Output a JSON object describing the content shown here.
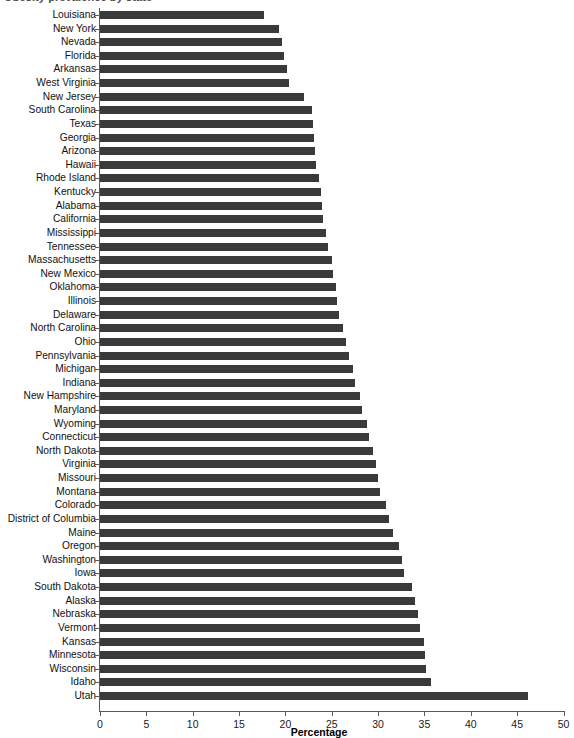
{
  "chart": {
    "title_partial": "Obesity prevalence by state",
    "xlabel": "Percentage",
    "ylabel": ""
  },
  "axis": {
    "x_ticks": [
      0,
      5,
      10,
      15,
      20,
      25,
      30,
      35,
      40,
      45,
      50
    ],
    "x_tick_labels": [
      "0",
      "5",
      "10",
      "15",
      "20",
      "25",
      "30",
      "35",
      "40",
      "45",
      "50"
    ]
  },
  "colors": {
    "bar": "#3a3a3a",
    "axis": "#5a5a5a",
    "text": "#111111",
    "background": "#ffffff"
  },
  "chart_data": {
    "type": "bar",
    "orientation": "horizontal",
    "xlabel": "Percentage",
    "ylabel": "",
    "xlim": [
      0,
      50
    ],
    "grid": false,
    "legend": null,
    "categories": [
      "Louisiana",
      "New York",
      "Nevada",
      "Florida",
      "Arkansas",
      "West Virginia",
      "New Jersey",
      "South Carolina",
      "Texas",
      "Georgia",
      "Arizona",
      "Hawaii",
      "Rhode Island",
      "Kentucky",
      "Alabama",
      "California",
      "Mississippi",
      "Tennessee",
      "Massachusetts",
      "New Mexico",
      "Oklahoma",
      "Illinois",
      "Delaware",
      "North Carolina",
      "Ohio",
      "Pennsylvania",
      "Michigan",
      "Indiana",
      "New Hampshire",
      "Maryland",
      "Wyoming",
      "Connecticut",
      "North Dakota",
      "Virginia",
      "Missouri",
      "Montana",
      "Colorado",
      "District of Columbia",
      "Maine",
      "Oregon",
      "Washington",
      "Iowa",
      "South Dakota",
      "Alaska",
      "Nebraska",
      "Vermont",
      "Kansas",
      "Minnesota",
      "Wisconsin",
      "Idaho",
      "Utah"
    ],
    "values": [
      17.7,
      19.3,
      19.6,
      19.9,
      20.2,
      20.4,
      22.0,
      22.9,
      23.0,
      23.1,
      23.2,
      23.3,
      23.6,
      23.8,
      23.9,
      24.1,
      24.4,
      24.6,
      25.0,
      25.1,
      25.5,
      25.6,
      25.8,
      26.2,
      26.5,
      26.9,
      27.3,
      27.5,
      28.0,
      28.3,
      28.8,
      29.0,
      29.4,
      29.8,
      30.0,
      30.2,
      30.9,
      31.2,
      31.6,
      32.3,
      32.6,
      32.8,
      33.7,
      34.0,
      34.3,
      34.5,
      34.9,
      35.1,
      35.2,
      35.7,
      46.2
    ]
  }
}
